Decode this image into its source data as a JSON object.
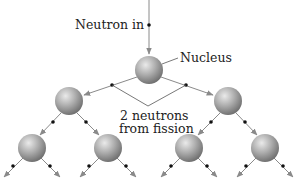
{
  "diagram": {
    "labels": {
      "neutron_in": "Neutron in",
      "nucleus": "Nucleus",
      "neutrons_line1": "2 neutrons",
      "neutrons_line2": "from fission"
    },
    "colors": {
      "sphere_light": "#e2e2e2",
      "sphere_mid": "#a9a9a9",
      "sphere_dark": "#6a6a6a",
      "arrow": "#8a8a8a",
      "neutron_dot": "#111111"
    },
    "nodes": [
      {
        "id": "n0",
        "level": 0,
        "x": 149,
        "y": 70
      },
      {
        "id": "n1",
        "level": 1,
        "x": 69,
        "y": 101
      },
      {
        "id": "n2",
        "level": 1,
        "x": 228,
        "y": 101
      },
      {
        "id": "n3",
        "level": 2,
        "x": 32,
        "y": 148
      },
      {
        "id": "n4",
        "level": 2,
        "x": 108,
        "y": 148
      },
      {
        "id": "n5",
        "level": 2,
        "x": 189,
        "y": 148
      },
      {
        "id": "n6",
        "level": 2,
        "x": 265,
        "y": 148
      }
    ]
  }
}
